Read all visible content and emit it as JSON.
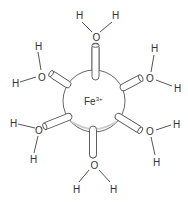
{
  "diagram": {
    "central_ion": {
      "symbol": "Fe",
      "charge": "3+"
    },
    "ligands": [
      {
        "position": "top",
        "oxygen": "O",
        "hydrogens": [
          "H",
          "H"
        ]
      },
      {
        "position": "upper-right",
        "oxygen": "O",
        "hydrogens": [
          "H",
          "H"
        ]
      },
      {
        "position": "lower-right",
        "oxygen": "O",
        "hydrogens": [
          "H",
          "H"
        ]
      },
      {
        "position": "bottom",
        "oxygen": "O",
        "hydrogens": [
          "H",
          "H"
        ]
      },
      {
        "position": "lower-left",
        "oxygen": "O",
        "hydrogens": [
          "H",
          "H"
        ]
      },
      {
        "position": "upper-left",
        "oxygen": "O",
        "hydrogens": [
          "H",
          "H"
        ]
      }
    ],
    "colors": {
      "line": "#555555",
      "text": "#333333",
      "background": "#ffffff"
    }
  }
}
